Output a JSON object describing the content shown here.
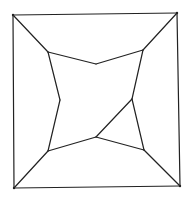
{
  "diagram": {
    "type": "planar-graph",
    "stroke_color": "#222222",
    "background_color": "#ffffff",
    "vertices": [
      {
        "id": "outer-tl",
        "x": 13,
        "y": 15
      },
      {
        "id": "outer-tr",
        "x": 177,
        "y": 13
      },
      {
        "id": "outer-br",
        "x": 180,
        "y": 186
      },
      {
        "id": "outer-bl",
        "x": 14,
        "y": 188
      },
      {
        "id": "inner-tl",
        "x": 48,
        "y": 52
      },
      {
        "id": "inner-top",
        "x": 96,
        "y": 64
      },
      {
        "id": "inner-tr",
        "x": 143,
        "y": 50
      },
      {
        "id": "inner-right",
        "x": 132,
        "y": 99
      },
      {
        "id": "inner-br",
        "x": 144,
        "y": 150
      },
      {
        "id": "inner-bottom",
        "x": 96,
        "y": 137
      },
      {
        "id": "inner-bl",
        "x": 48,
        "y": 151
      },
      {
        "id": "inner-left",
        "x": 60,
        "y": 100
      }
    ],
    "edges": [
      {
        "from": "outer-tl",
        "to": "outer-tr"
      },
      {
        "from": "outer-tr",
        "to": "outer-br"
      },
      {
        "from": "outer-br",
        "to": "outer-bl"
      },
      {
        "from": "outer-bl",
        "to": "outer-tl"
      },
      {
        "from": "outer-tl",
        "to": "inner-tl"
      },
      {
        "from": "outer-tr",
        "to": "inner-tr"
      },
      {
        "from": "outer-br",
        "to": "inner-br"
      },
      {
        "from": "outer-bl",
        "to": "inner-bl"
      },
      {
        "from": "inner-tl",
        "to": "inner-top"
      },
      {
        "from": "inner-top",
        "to": "inner-tr"
      },
      {
        "from": "inner-tr",
        "to": "inner-right"
      },
      {
        "from": "inner-right",
        "to": "inner-br"
      },
      {
        "from": "inner-br",
        "to": "inner-bottom"
      },
      {
        "from": "inner-bottom",
        "to": "inner-bl"
      },
      {
        "from": "inner-bl",
        "to": "inner-left"
      },
      {
        "from": "inner-left",
        "to": "inner-tl"
      },
      {
        "from": "inner-right",
        "to": "inner-bottom"
      }
    ]
  }
}
